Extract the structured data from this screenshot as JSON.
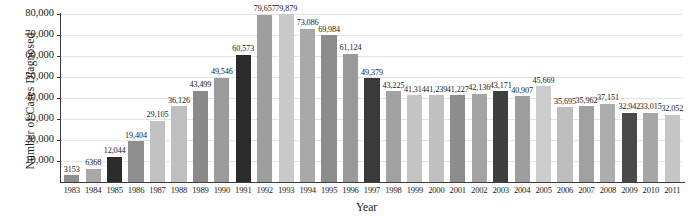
{
  "chart_data": {
    "type": "bar",
    "title": "",
    "xlabel": "Year",
    "ylabel": "Number of Cases Diagnosed",
    "ylim": [
      0,
      80000
    ],
    "ytick_labels": [
      "10,000",
      "20,000",
      "30,000",
      "40,000",
      "50,000",
      "60,000",
      "70,000",
      "80,000"
    ],
    "ytick_values": [
      10000,
      20000,
      30000,
      40000,
      50000,
      60000,
      70000,
      80000
    ],
    "grid": true,
    "legend": "none",
    "categories": [
      "1983",
      "1984",
      "1985",
      "1986",
      "1987",
      "1988",
      "1989",
      "1990",
      "1991",
      "1992",
      "1993",
      "1994",
      "1995",
      "1996",
      "1997",
      "1998",
      "1999",
      "2000",
      "2001",
      "2002",
      "2003",
      "2004",
      "2005",
      "2006",
      "2007",
      "2008",
      "2009",
      "2010",
      "2011"
    ],
    "values": [
      3153,
      6368,
      12044,
      19404,
      29105,
      36126,
      43499,
      49546,
      60573,
      79657,
      79879,
      73086,
      69984,
      61124,
      49379,
      43225,
      41314,
      41239,
      41227,
      42136,
      43171,
      40907,
      45669,
      35695,
      35962,
      37151,
      32942,
      33015,
      32052
    ],
    "value_labels": [
      "3153",
      "6368",
      "12,044",
      "19,404",
      "29,105",
      "36,126",
      "43,499",
      "49,546",
      "60,573",
      "79,657",
      "79,879",
      "73,086",
      "69,984",
      "61,124",
      "49,379",
      "43,225",
      "41,314",
      "41,239",
      "41,227",
      "42,136",
      "43,171",
      "40,907",
      "45,669",
      "35,695",
      "35,962",
      "37,151",
      "32,942",
      "33,015",
      "32,052"
    ],
    "bar_colors": [
      "#8f8f8f",
      "#a8a8a8",
      "#2b2b2b",
      "#8f8f8f",
      "#c2c2c2",
      "#bfbfbf",
      "#8a8a8a",
      "#9b9b9b",
      "#2b2b2b",
      "#9e9e9e",
      "#c9c9c9",
      "#a9a9a9",
      "#8c8c8c",
      "#9a9a9a",
      "#3a3a3a",
      "#a2a2a2",
      "#c4c4c4",
      "#c0c0c0",
      "#8d8d8d",
      "#a4a4a4",
      "#3f3f3f",
      "#9e9e9e",
      "#cccccc",
      "#bdbdbd",
      "#a0a0a0",
      "#adadad",
      "#4a4a4a",
      "#a6a6a6",
      "#c6c6c6"
    ],
    "highlighted_categories": [
      "1985",
      "1991",
      "1997",
      "2003",
      "2009"
    ],
    "axis_color": "#3a3a3a",
    "grid_color": "#e3e3e3",
    "background_color": "#ffffff"
  }
}
